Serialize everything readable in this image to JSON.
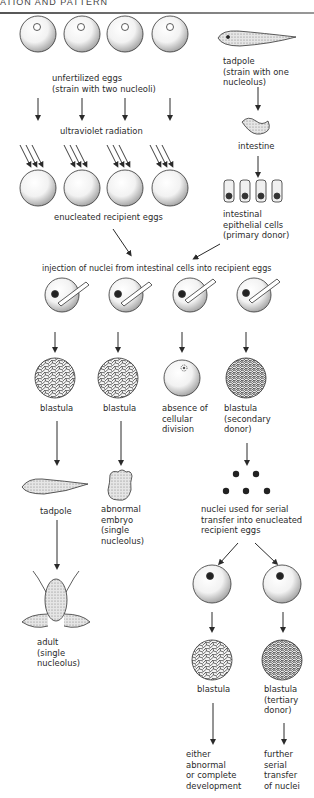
{
  "header": {
    "running_title": "ATION AND PATTERN"
  },
  "donor_strain": {
    "tadpole_label": "tadpole",
    "tadpole_note_1": "(strain with one",
    "tadpole_note_2": "nucleolus)",
    "intestine_label": "intestine",
    "cells_label_1": "intestinal",
    "cells_label_2": "epithelial cells",
    "cells_label_3": "(primary donor)"
  },
  "recipient_strain": {
    "eggs_label_1": "unfertilized eggs",
    "eggs_label_2": "(strain with two nucleoli)",
    "uv_label": "ultraviolet radiation",
    "enucleated_label": "enucleated recipient eggs"
  },
  "injection": {
    "label": "injection of nuclei from intestinal cells into recipient eggs"
  },
  "outcomes": [
    {
      "stage": "blastula",
      "result": "tadpole",
      "final_1": "adult",
      "final_2": "(single",
      "final_3": "nucleolus)"
    },
    {
      "stage": "blastula",
      "result_1": "abnormal",
      "result_2": "embryo",
      "result_3": "(single",
      "result_4": "nucleolus)"
    },
    {
      "stage_1": "absence of",
      "stage_2": "cellular",
      "stage_3": "division"
    },
    {
      "stage_1": "blastula",
      "stage_2": "(secondary",
      "stage_3": "donor)"
    }
  ],
  "serial_transfer": {
    "nuclei_label_1": "nuclei used for serial",
    "nuclei_label_2": "transfer into enucleated",
    "nuclei_label_3": "recipient eggs",
    "left_stage": "blastula",
    "left_result_1": "either",
    "left_result_2": "abnormal",
    "left_result_3": "or complete",
    "left_result_4": "development",
    "right_stage_1": "blastula",
    "right_stage_2": "(tertiary",
    "right_stage_3": "donor)",
    "right_result_1": "further",
    "right_result_2": "serial",
    "right_result_3": "transfer",
    "right_result_4": "of nuclei"
  },
  "colors": {
    "ink": "#2a2a2a",
    "stipple": "#9a9a9a",
    "paper": "#ffffff"
  }
}
